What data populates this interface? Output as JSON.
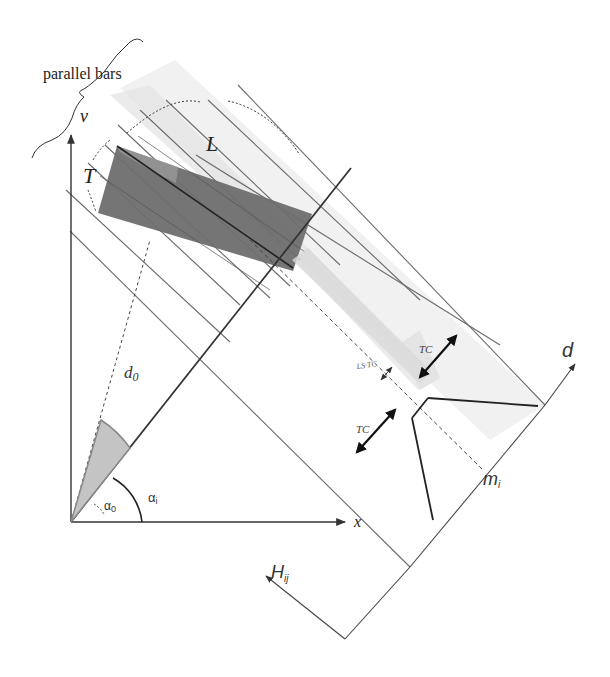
{
  "diagram": {
    "labels": {
      "parallel_bars": "parallel bars",
      "v_axis": "v",
      "x_axis": "x",
      "L": "L",
      "T": "T",
      "d0": "d",
      "d0_sub": "0",
      "alpha0": "α",
      "alpha0_sub": "0",
      "alphai": "α",
      "alphai_sub": "i",
      "d_axis": "d",
      "mi": "m",
      "mi_sub": "i",
      "Hij": "H",
      "Hij_sub": "ij",
      "TC_upper": "TC",
      "TC_lower": "TC",
      "center_width": "LS·TC"
    },
    "colors": {
      "line": "#3a3a3a",
      "thin_line": "#555555",
      "rect_fill": "#6e6e6e",
      "band_fill": "#e6e6e6",
      "wedge_fill": "#c8c8c8"
    }
  }
}
